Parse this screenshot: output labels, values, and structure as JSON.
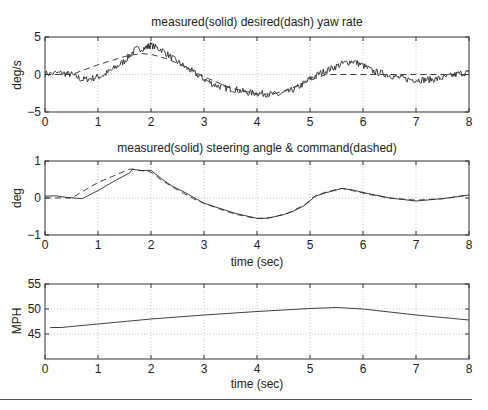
{
  "chart_data": [
    {
      "type": "line",
      "title": "measured(solid)  desired(dash) yaw rate",
      "xlabel": "",
      "ylabel": "deg/s",
      "xlim": [
        0,
        8
      ],
      "ylim": [
        -5,
        5
      ],
      "xticks": [
        0,
        1,
        2,
        3,
        4,
        5,
        6,
        7,
        8
      ],
      "yticks": [
        -5,
        0,
        5
      ],
      "ytick_labels": [
        "−5",
        "0",
        "5"
      ],
      "grid": true,
      "series": [
        {
          "name": "measured",
          "style": "solid",
          "noise": 0.45,
          "x": [
            0,
            0.3,
            0.5,
            0.7,
            0.9,
            1.1,
            1.3,
            1.5,
            1.7,
            1.9,
            2.0,
            2.2,
            2.4,
            2.6,
            2.8,
            3.0,
            3.2,
            3.4,
            3.6,
            3.8,
            4.0,
            4.2,
            4.4,
            4.6,
            4.8,
            5.0,
            5.2,
            5.4,
            5.6,
            5.8,
            6.0,
            6.2,
            6.4,
            6.6,
            6.8,
            7.0,
            7.2,
            7.4,
            7.6,
            7.8,
            8.0
          ],
          "values": [
            0.1,
            0.2,
            0.0,
            -0.7,
            -0.5,
            -0.1,
            0.8,
            1.8,
            3.3,
            3.6,
            3.9,
            3.3,
            2.2,
            1.2,
            0.3,
            -0.6,
            -1.4,
            -1.8,
            -2.0,
            -2.4,
            -2.5,
            -2.6,
            -2.7,
            -2.3,
            -1.6,
            -0.6,
            0.2,
            0.8,
            1.4,
            1.8,
            1.2,
            0.4,
            0.1,
            -0.3,
            -0.6,
            -0.7,
            -0.7,
            -0.6,
            -0.3,
            0.1,
            0.3
          ]
        },
        {
          "name": "desired",
          "style": "dashed",
          "noise": 0,
          "x": [
            0,
            0.5,
            1.0,
            1.5,
            1.8,
            2.0,
            2.3,
            2.6,
            3.0,
            3.5,
            4.0,
            4.3,
            4.6,
            5.0,
            5.3,
            5.5,
            6.0,
            7.0,
            8.0
          ],
          "values": [
            0.0,
            0.0,
            1.3,
            2.4,
            2.8,
            2.7,
            2.1,
            1.2,
            -0.3,
            -1.8,
            -2.6,
            -2.6,
            -2.0,
            -0.8,
            0.0,
            0.0,
            0.0,
            0.0,
            0.0
          ]
        }
      ]
    },
    {
      "type": "line",
      "title": "measured(solid) steering angle & command(dashed)",
      "xlabel": "time (sec)",
      "ylabel": "deg",
      "xlim": [
        0,
        8
      ],
      "ylim": [
        -1,
        1
      ],
      "xticks": [
        0,
        1,
        2,
        3,
        4,
        5,
        6,
        7,
        8
      ],
      "yticks": [
        -1,
        0,
        1
      ],
      "ytick_labels": [
        "−1",
        "0",
        "1"
      ],
      "grid": true,
      "series": [
        {
          "name": "measured",
          "style": "solid",
          "noise": 0,
          "x": [
            0,
            0.2,
            0.4,
            0.7,
            1.0,
            1.3,
            1.6,
            1.65,
            1.8,
            2.0,
            2.2,
            2.4,
            2.6,
            2.8,
            3.0,
            3.3,
            3.6,
            4.0,
            4.2,
            4.5,
            4.7,
            4.9,
            5.1,
            5.3,
            5.6,
            5.8,
            6.1,
            6.5,
            7.0,
            7.5,
            8.0
          ],
          "values": [
            0.05,
            0.06,
            0.02,
            -0.02,
            0.2,
            0.45,
            0.68,
            0.78,
            0.74,
            0.75,
            0.52,
            0.32,
            0.18,
            0.02,
            -0.14,
            -0.28,
            -0.42,
            -0.55,
            -0.55,
            -0.45,
            -0.35,
            -0.2,
            0.05,
            0.14,
            0.26,
            0.22,
            0.12,
            0.0,
            -0.08,
            -0.02,
            0.08
          ]
        },
        {
          "name": "command",
          "style": "dashed",
          "noise": 0,
          "x": [
            0,
            0.5,
            1.0,
            1.3,
            1.6,
            1.7,
            2.0,
            2.2,
            2.4,
            2.6,
            2.8,
            3.0,
            3.3,
            3.6,
            4.0,
            4.3,
            4.6,
            4.9,
            5.1,
            5.3,
            5.6,
            5.8,
            6.1,
            6.5,
            7.0,
            7.5,
            8.0
          ],
          "values": [
            0.0,
            0.0,
            0.42,
            0.6,
            0.78,
            0.77,
            0.7,
            0.48,
            0.3,
            0.14,
            -0.02,
            -0.14,
            -0.3,
            -0.44,
            -0.56,
            -0.52,
            -0.4,
            -0.18,
            0.06,
            0.16,
            0.26,
            0.2,
            0.1,
            0.0,
            -0.06,
            -0.02,
            0.08
          ]
        }
      ]
    },
    {
      "type": "line",
      "title": "",
      "xlabel": "time (sec)",
      "ylabel": "MPH",
      "xlim": [
        0,
        8
      ],
      "ylim": [
        40,
        55
      ],
      "xticks": [
        0,
        1,
        2,
        3,
        4,
        5,
        6,
        7,
        8
      ],
      "yticks": [
        45,
        50,
        55
      ],
      "ytick_labels": [
        "45",
        "50",
        "55"
      ],
      "grid": true,
      "series": [
        {
          "name": "speed",
          "style": "solid",
          "noise": 0,
          "x": [
            0.1,
            0.3,
            1.0,
            2.0,
            3.0,
            4.0,
            5.0,
            5.5,
            6.0,
            7.0,
            7.5,
            8.0
          ],
          "values": [
            46.3,
            46.3,
            47.0,
            48.0,
            48.8,
            49.5,
            50.1,
            50.3,
            50.0,
            48.8,
            48.3,
            47.8
          ]
        }
      ]
    }
  ],
  "panels": [
    {
      "title": "measured(solid)  desired(dash) yaw rate",
      "ylabel": "deg/s",
      "xlabel": ""
    },
    {
      "title": "measured(solid) steering angle & command(dashed)",
      "ylabel": "deg",
      "xlabel": "time (sec)"
    },
    {
      "title": "",
      "ylabel": "MPH",
      "xlabel": "time (sec)"
    }
  ],
  "colors": {
    "line": "#2a2a2a",
    "axis": "#333333",
    "grid": "#b8b8b8",
    "background": "#ffffff"
  }
}
